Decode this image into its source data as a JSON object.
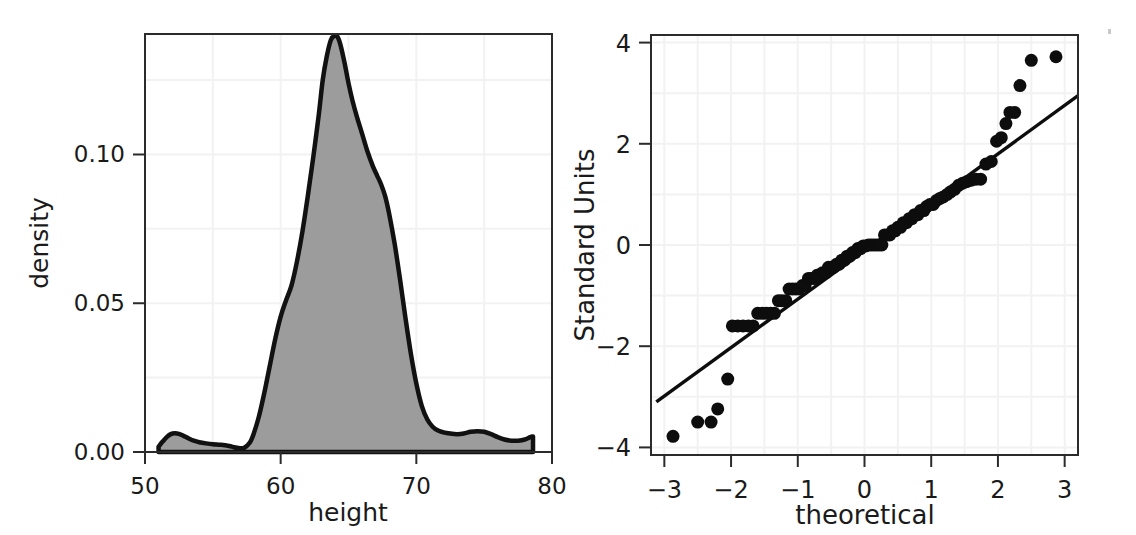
{
  "figure": {
    "background_color": "#ffffff",
    "panel_count": 2
  },
  "chart_data": [
    {
      "type": "area",
      "panel": "left",
      "title": "",
      "xlabel": "height",
      "ylabel": "density",
      "xlim": [
        50,
        80
      ],
      "ylim": [
        0,
        0.1405
      ],
      "xticks": [
        50,
        60,
        70,
        80
      ],
      "xtick_labels": [
        "50",
        "60",
        "70",
        "80"
      ],
      "yticks": [
        0.0,
        0.05,
        0.1
      ],
      "ytick_labels": [
        "0.00",
        "0.05",
        "0.10"
      ],
      "grid": true,
      "fill_color": "#9c9c9c",
      "line_color": "#111111",
      "x": [
        51.0,
        51.3,
        51.6,
        51.9,
        52.2,
        52.5,
        52.8,
        53.2,
        53.6,
        54.0,
        54.5,
        55.0,
        55.6,
        56.2,
        56.8,
        57.3,
        57.7,
        58.0,
        58.4,
        58.8,
        59.2,
        59.6,
        60.0,
        60.4,
        60.8,
        61.2,
        61.6,
        62.0,
        62.4,
        62.8,
        63.1,
        63.4,
        63.7,
        64.0,
        64.2,
        64.4,
        64.7,
        65.0,
        65.3,
        65.6,
        66.0,
        66.4,
        66.8,
        67.1,
        67.4,
        67.7,
        68.0,
        68.4,
        68.8,
        69.2,
        69.6,
        70.0,
        70.4,
        70.8,
        71.2,
        71.6,
        72.0,
        72.5,
        73.0,
        73.5,
        74.0,
        74.5,
        75.0,
        75.5,
        76.0,
        76.5,
        77.0,
        77.5,
        78.0,
        78.4,
        78.6
      ],
      "y": [
        0.0018,
        0.0035,
        0.005,
        0.006,
        0.0063,
        0.0061,
        0.0055,
        0.0046,
        0.0038,
        0.0033,
        0.0029,
        0.0026,
        0.0024,
        0.002,
        0.0014,
        0.0014,
        0.003,
        0.006,
        0.012,
        0.02,
        0.029,
        0.038,
        0.0455,
        0.051,
        0.056,
        0.064,
        0.074,
        0.086,
        0.099,
        0.113,
        0.125,
        0.133,
        0.1385,
        0.14,
        0.1395,
        0.137,
        0.131,
        0.124,
        0.118,
        0.113,
        0.107,
        0.101,
        0.096,
        0.093,
        0.09,
        0.086,
        0.08,
        0.07,
        0.058,
        0.045,
        0.033,
        0.023,
        0.0155,
        0.011,
        0.0085,
        0.0072,
        0.0066,
        0.0062,
        0.006,
        0.0062,
        0.0068,
        0.007,
        0.0068,
        0.006,
        0.005,
        0.0042,
        0.0038,
        0.0038,
        0.0042,
        0.005,
        0.0052
      ]
    },
    {
      "type": "scatter",
      "panel": "right",
      "title": "",
      "xlabel": "theoretical",
      "ylabel": "Standard Units",
      "xlim": [
        -3.2,
        3.2
      ],
      "ylim": [
        -4.15,
        4.15
      ],
      "xticks": [
        -3,
        -2,
        -1,
        0,
        1,
        2,
        3
      ],
      "xtick_labels": [
        "−3",
        "−2",
        "−1",
        "0",
        "1",
        "2",
        "3"
      ],
      "yticks": [
        -4,
        -2,
        0,
        2,
        4
      ],
      "ytick_labels": [
        "−4",
        "−2",
        "0",
        "2",
        "4"
      ],
      "grid": true,
      "point_color": "#0d0d0d",
      "point_size": 13,
      "reference_line": {
        "x": [
          -3.12,
          3.2
        ],
        "y": [
          -3.1,
          2.95
        ],
        "color": "#0d0d0d"
      },
      "points": [
        [
          -2.87,
          -3.78
        ],
        [
          -2.5,
          -3.5
        ],
        [
          -2.3,
          -3.5
        ],
        [
          -2.2,
          -3.24
        ],
        [
          -2.05,
          -2.65
        ],
        [
          -1.98,
          -1.6
        ],
        [
          -1.9,
          -1.6
        ],
        [
          -1.82,
          -1.6
        ],
        [
          -1.74,
          -1.6
        ],
        [
          -1.67,
          -1.6
        ],
        [
          -1.6,
          -1.35
        ],
        [
          -1.53,
          -1.35
        ],
        [
          -1.47,
          -1.35
        ],
        [
          -1.41,
          -1.35
        ],
        [
          -1.35,
          -1.35
        ],
        [
          -1.29,
          -1.1
        ],
        [
          -1.24,
          -1.1
        ],
        [
          -1.18,
          -1.1
        ],
        [
          -1.13,
          -0.87
        ],
        [
          -1.08,
          -0.87
        ],
        [
          -1.03,
          -0.87
        ],
        [
          -0.98,
          -0.87
        ],
        [
          -0.93,
          -0.8
        ],
        [
          -0.89,
          -0.8
        ],
        [
          -0.84,
          -0.66
        ],
        [
          -0.8,
          -0.66
        ],
        [
          -0.75,
          -0.66
        ],
        [
          -0.71,
          -0.6
        ],
        [
          -0.67,
          -0.6
        ],
        [
          -0.63,
          -0.55
        ],
        [
          -0.58,
          -0.55
        ],
        [
          -0.54,
          -0.44
        ],
        [
          -0.5,
          -0.44
        ],
        [
          -0.46,
          -0.44
        ],
        [
          -0.42,
          -0.38
        ],
        [
          -0.38,
          -0.38
        ],
        [
          -0.34,
          -0.3
        ],
        [
          -0.3,
          -0.3
        ],
        [
          -0.26,
          -0.22
        ],
        [
          -0.22,
          -0.22
        ],
        [
          -0.18,
          -0.15
        ],
        [
          -0.14,
          -0.15
        ],
        [
          -0.1,
          -0.07
        ],
        [
          -0.06,
          -0.07
        ],
        [
          -0.02,
          -0.02
        ],
        [
          0.02,
          -0.02
        ],
        [
          0.06,
          0.0
        ],
        [
          0.1,
          0.0
        ],
        [
          0.14,
          0.0
        ],
        [
          0.18,
          0.0
        ],
        [
          0.22,
          0.0
        ],
        [
          0.26,
          0.0
        ],
        [
          0.3,
          0.2
        ],
        [
          0.34,
          0.2
        ],
        [
          0.38,
          0.2
        ],
        [
          0.42,
          0.28
        ],
        [
          0.46,
          0.28
        ],
        [
          0.5,
          0.35
        ],
        [
          0.54,
          0.35
        ],
        [
          0.58,
          0.44
        ],
        [
          0.63,
          0.44
        ],
        [
          0.67,
          0.52
        ],
        [
          0.71,
          0.52
        ],
        [
          0.75,
          0.6
        ],
        [
          0.8,
          0.6
        ],
        [
          0.84,
          0.68
        ],
        [
          0.89,
          0.68
        ],
        [
          0.93,
          0.76
        ],
        [
          0.98,
          0.8
        ],
        [
          1.03,
          0.8
        ],
        [
          1.08,
          0.88
        ],
        [
          1.13,
          0.92
        ],
        [
          1.18,
          0.95
        ],
        [
          1.24,
          1.0
        ],
        [
          1.29,
          1.05
        ],
        [
          1.35,
          1.1
        ],
        [
          1.41,
          1.18
        ],
        [
          1.47,
          1.22
        ],
        [
          1.53,
          1.25
        ],
        [
          1.6,
          1.28
        ],
        [
          1.67,
          1.3
        ],
        [
          1.74,
          1.3
        ],
        [
          1.82,
          1.6
        ],
        [
          1.9,
          1.65
        ],
        [
          1.98,
          2.05
        ],
        [
          2.05,
          2.12
        ],
        [
          2.12,
          2.4
        ],
        [
          2.18,
          2.62
        ],
        [
          2.25,
          2.62
        ],
        [
          2.33,
          3.15
        ],
        [
          2.5,
          3.65
        ],
        [
          2.87,
          3.72
        ]
      ]
    }
  ]
}
